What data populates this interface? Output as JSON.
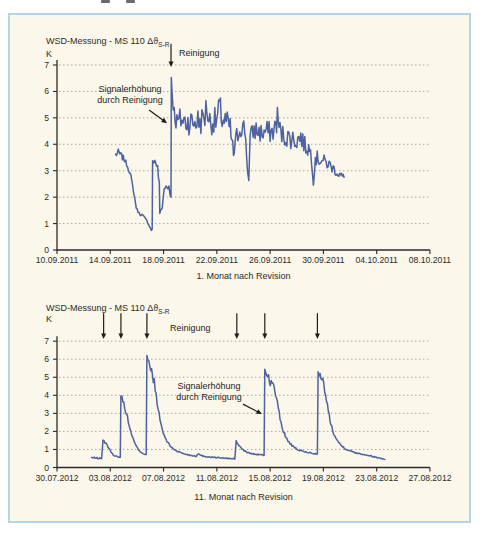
{
  "figure": {
    "border_color": "#b4d5e4",
    "background_color": "#fbf7eb",
    "line_color": "#4e61a0",
    "grid_color": "#9a9a94",
    "axis_color": "#2b2b29",
    "annotation_color": "#1d1d1b"
  },
  "chart_data": [
    {
      "type": "line",
      "title": "WSD-Messung - MS 110 Δϑ",
      "title_subscript": "S-R",
      "unit_label": "K",
      "xlabel": "1. Monat nach Revision",
      "x_tick_labels": [
        "10.09.2011",
        "14.09.2011",
        "18.09.2011",
        "22.09.2011",
        "26.09.2011",
        "30.09.2011",
        "04.10.2011",
        "08.10.2011"
      ],
      "y_tick_labels": [
        "0",
        "1",
        "2",
        "3",
        "4",
        "5",
        "6",
        "7"
      ],
      "ylim": [
        0,
        7
      ],
      "x_range_days": [
        0,
        28
      ],
      "grid": "horizontal-dotted",
      "annotations": {
        "cleaning_label": "Reinigung",
        "signal_label": [
          "Signalerhöhung",
          "durch Reinigung"
        ]
      },
      "cleaning_arrows": [
        {
          "day": 8.56,
          "k_from": 7.8,
          "k_to": 6.92
        }
      ],
      "signal_arrow": {
        "from_day": 6.91,
        "from_k": 5.3,
        "to_day": 8.26,
        "to_k": 4.8
      },
      "noise_seed": 7,
      "anchors_format": [
        "day_from_first_tick",
        "delta_theta_K",
        "noise_amplitude_K"
      ],
      "anchors": [
        [
          4.4,
          3.6,
          0.15
        ],
        [
          4.6,
          3.7,
          0.12
        ],
        [
          4.85,
          3.55,
          0.12
        ],
        [
          5.1,
          3.4,
          0.1
        ],
        [
          5.3,
          3.15,
          0.06
        ],
        [
          5.55,
          2.8,
          0.05
        ],
        [
          5.75,
          2.2,
          0.05
        ],
        [
          5.95,
          1.6,
          0.04
        ],
        [
          6.15,
          1.4,
          0.05
        ],
        [
          6.45,
          1.3,
          0.05
        ],
        [
          6.75,
          1.1,
          0.04
        ],
        [
          6.95,
          0.9,
          0.04
        ],
        [
          7.08,
          0.75,
          0.03
        ],
        [
          7.15,
          0.8,
          0.03
        ],
        [
          7.18,
          3.35,
          0.05
        ],
        [
          7.35,
          3.3,
          0.12
        ],
        [
          7.55,
          3.2,
          0.1
        ],
        [
          7.62,
          2.7,
          0.08
        ],
        [
          7.68,
          2.6,
          0.06
        ],
        [
          7.72,
          1.4,
          0.04
        ],
        [
          7.9,
          1.6,
          0.06
        ],
        [
          8.05,
          2.3,
          0.1
        ],
        [
          8.25,
          2.45,
          0.15
        ],
        [
          8.4,
          2.4,
          0.12
        ],
        [
          8.5,
          2.05,
          0.06
        ],
        [
          8.56,
          2.0,
          0.04
        ],
        [
          8.58,
          6.55,
          0.05
        ],
        [
          8.65,
          5.9,
          0.25
        ],
        [
          8.8,
          5.2,
          0.35
        ],
        [
          9.0,
          4.8,
          0.45
        ],
        [
          9.3,
          4.95,
          0.5
        ],
        [
          9.6,
          4.85,
          0.5
        ],
        [
          9.9,
          4.9,
          0.55
        ],
        [
          10.2,
          4.8,
          0.5
        ],
        [
          10.5,
          4.9,
          0.55
        ],
        [
          10.8,
          4.85,
          0.5
        ],
        [
          11.1,
          5.1,
          0.6
        ],
        [
          11.25,
          5.45,
          0.55
        ],
        [
          11.4,
          4.9,
          0.5
        ],
        [
          11.7,
          4.85,
          0.5
        ],
        [
          12.0,
          4.9,
          0.55
        ],
        [
          12.2,
          5.4,
          0.55
        ],
        [
          12.4,
          4.95,
          0.5
        ],
        [
          12.7,
          4.85,
          0.5
        ],
        [
          13.0,
          4.6,
          0.45
        ],
        [
          13.25,
          3.6,
          0.35
        ],
        [
          13.5,
          4.3,
          0.4
        ],
        [
          13.8,
          4.7,
          0.45
        ],
        [
          14.1,
          4.6,
          0.4
        ],
        [
          14.3,
          3.3,
          0.5
        ],
        [
          14.4,
          2.6,
          0.15
        ],
        [
          14.5,
          4.2,
          0.4
        ],
        [
          14.8,
          4.55,
          0.4
        ],
        [
          15.1,
          4.5,
          0.45
        ],
        [
          15.4,
          4.4,
          0.4
        ],
        [
          15.7,
          4.5,
          0.45
        ],
        [
          16.0,
          4.45,
          0.4
        ],
        [
          16.3,
          4.5,
          0.45
        ],
        [
          16.55,
          5.0,
          0.5
        ],
        [
          16.8,
          4.4,
          0.4
        ],
        [
          17.1,
          4.3,
          0.4
        ],
        [
          17.4,
          4.25,
          0.4
        ],
        [
          17.7,
          4.2,
          0.4
        ],
        [
          18.0,
          4.15,
          0.4
        ],
        [
          18.3,
          4.3,
          0.4
        ],
        [
          18.6,
          3.95,
          0.35
        ],
        [
          18.9,
          3.85,
          0.35
        ],
        [
          19.1,
          3.6,
          0.3
        ],
        [
          19.25,
          2.7,
          0.25
        ],
        [
          19.4,
          3.5,
          0.3
        ],
        [
          19.6,
          3.45,
          0.28
        ],
        [
          19.9,
          3.4,
          0.25
        ],
        [
          20.2,
          3.3,
          0.25
        ],
        [
          20.5,
          3.2,
          0.22
        ],
        [
          20.8,
          3.05,
          0.2
        ],
        [
          21.1,
          2.9,
          0.18
        ],
        [
          21.35,
          2.8,
          0.15
        ],
        [
          21.55,
          2.75,
          0.12
        ]
      ]
    },
    {
      "type": "line",
      "title": "WSD-Messung - MS 110 Δϑ",
      "title_subscript": "S-R",
      "unit_label": "K",
      "xlabel": "11. Monat nach Revision",
      "x_tick_labels": [
        "30.07.2012",
        "03.08.2012",
        "07.08.2012",
        "11.08.2012",
        "15.08.2012",
        "19.08.2012",
        "23.08.2012",
        "27.08.2012"
      ],
      "y_tick_labels": [
        "0",
        "1",
        "2",
        "3",
        "4",
        "5",
        "6",
        "7"
      ],
      "ylim": [
        0,
        7
      ],
      "x_range_days": [
        0,
        28
      ],
      "grid": "horizontal-dotted",
      "annotations": {
        "cleaning_label": "Reinigung",
        "signal_label": [
          "Signalerhöhung",
          "durch Reinigung"
        ]
      },
      "cleaning_arrows": [
        {
          "day": 3.5,
          "k_from": 8.55,
          "k_to": 7.12
        },
        {
          "day": 4.8,
          "k_from": 8.55,
          "k_to": 7.12
        },
        {
          "day": 6.75,
          "k_from": 8.55,
          "k_to": 7.12
        },
        {
          "day": 13.5,
          "k_from": 8.55,
          "k_to": 7.12
        },
        {
          "day": 15.6,
          "k_from": 8.55,
          "k_to": 7.12
        },
        {
          "day": 19.55,
          "k_from": 8.55,
          "k_to": 7.12
        }
      ],
      "signal_arrow": {
        "from_day": 13.96,
        "from_k": 3.51,
        "to_day": 15.39,
        "to_k": 2.96
      },
      "noise_seed": 13,
      "anchors_format": [
        "day_from_first_tick",
        "delta_theta_K",
        "noise_amplitude_K"
      ],
      "anchors": [
        [
          2.6,
          0.55,
          0.04
        ],
        [
          3.0,
          0.52,
          0.04
        ],
        [
          3.35,
          0.5,
          0.03
        ],
        [
          3.45,
          1.5,
          0.06
        ],
        [
          3.6,
          1.4,
          0.1
        ],
        [
          3.75,
          1.3,
          0.1
        ],
        [
          3.9,
          1.05,
          0.05
        ],
        [
          4.1,
          0.8,
          0.04
        ],
        [
          4.3,
          0.65,
          0.03
        ],
        [
          4.55,
          0.6,
          0.03
        ],
        [
          4.75,
          0.58,
          0.03
        ],
        [
          4.8,
          4.0,
          0.06
        ],
        [
          4.95,
          3.7,
          0.25
        ],
        [
          5.15,
          3.2,
          0.18
        ],
        [
          5.35,
          2.55,
          0.1
        ],
        [
          5.55,
          1.95,
          0.08
        ],
        [
          5.8,
          1.4,
          0.06
        ],
        [
          6.05,
          1.05,
          0.05
        ],
        [
          6.3,
          0.85,
          0.04
        ],
        [
          6.55,
          0.75,
          0.03
        ],
        [
          6.7,
          0.72,
          0.03
        ],
        [
          6.75,
          6.2,
          0.06
        ],
        [
          6.9,
          5.7,
          0.3
        ],
        [
          7.1,
          5.2,
          0.35
        ],
        [
          7.3,
          4.7,
          0.3
        ],
        [
          7.45,
          4.0,
          0.15
        ],
        [
          7.6,
          3.2,
          0.12
        ],
        [
          7.8,
          2.4,
          0.1
        ],
        [
          8.0,
          1.85,
          0.08
        ],
        [
          8.25,
          1.45,
          0.06
        ],
        [
          8.55,
          1.15,
          0.05
        ],
        [
          8.9,
          0.95,
          0.04
        ],
        [
          9.3,
          0.82,
          0.04
        ],
        [
          9.7,
          0.73,
          0.03
        ],
        [
          10.1,
          0.67,
          0.03
        ],
        [
          10.45,
          0.63,
          0.03
        ],
        [
          10.6,
          0.78,
          0.04
        ],
        [
          10.8,
          0.66,
          0.03
        ],
        [
          11.2,
          0.6,
          0.03
        ],
        [
          11.7,
          0.57,
          0.03
        ],
        [
          12.3,
          0.53,
          0.03
        ],
        [
          12.9,
          0.5,
          0.03
        ],
        [
          13.35,
          0.48,
          0.03
        ],
        [
          13.45,
          1.45,
          0.06
        ],
        [
          13.6,
          1.3,
          0.08
        ],
        [
          13.8,
          1.1,
          0.06
        ],
        [
          14.05,
          0.92,
          0.04
        ],
        [
          14.35,
          0.82,
          0.04
        ],
        [
          14.75,
          0.75,
          0.03
        ],
        [
          15.15,
          0.71,
          0.03
        ],
        [
          15.55,
          0.68,
          0.03
        ],
        [
          15.6,
          5.45,
          0.06
        ],
        [
          15.75,
          5.15,
          0.28
        ],
        [
          15.95,
          4.9,
          0.3
        ],
        [
          16.15,
          4.65,
          0.28
        ],
        [
          16.35,
          4.3,
          0.2
        ],
        [
          16.55,
          3.55,
          0.15
        ],
        [
          16.75,
          2.7,
          0.1
        ],
        [
          16.95,
          2.1,
          0.08
        ],
        [
          17.2,
          1.65,
          0.06
        ],
        [
          17.5,
          1.3,
          0.05
        ],
        [
          17.85,
          1.08,
          0.05
        ],
        [
          18.2,
          0.95,
          0.04
        ],
        [
          18.6,
          0.87,
          0.04
        ],
        [
          19.0,
          0.81,
          0.03
        ],
        [
          19.4,
          0.76,
          0.03
        ],
        [
          19.55,
          0.74,
          0.03
        ],
        [
          19.6,
          5.3,
          0.06
        ],
        [
          19.75,
          5.0,
          0.28
        ],
        [
          19.95,
          4.7,
          0.28
        ],
        [
          20.1,
          4.35,
          0.22
        ],
        [
          20.3,
          3.45,
          0.15
        ],
        [
          20.5,
          2.6,
          0.1
        ],
        [
          20.75,
          1.95,
          0.08
        ],
        [
          21.0,
          1.55,
          0.06
        ],
        [
          21.3,
          1.25,
          0.05
        ],
        [
          21.65,
          1.05,
          0.05
        ],
        [
          22.0,
          0.92,
          0.04
        ],
        [
          22.4,
          0.83,
          0.04
        ],
        [
          22.8,
          0.76,
          0.03
        ],
        [
          23.2,
          0.7,
          0.03
        ],
        [
          23.6,
          0.63,
          0.03
        ],
        [
          24.0,
          0.56,
          0.03
        ],
        [
          24.35,
          0.5,
          0.03
        ],
        [
          24.6,
          0.45,
          0.03
        ]
      ]
    }
  ]
}
